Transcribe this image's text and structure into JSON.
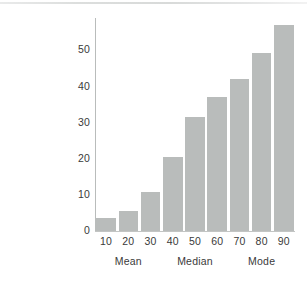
{
  "figure": {
    "background_color": "#ffffff",
    "bar_color": "#b9bcbb",
    "axis_color": "#bcbfbe",
    "text_color": "#3a3a3a"
  },
  "chart_data": {
    "type": "bar",
    "title": "",
    "subtitle": "",
    "xlabel": "",
    "ylabel": "",
    "categories": [
      "10",
      "20",
      "30",
      "40",
      "50",
      "60",
      "70",
      "80",
      "90"
    ],
    "values": [
      3.5,
      5.5,
      10.8,
      20.4,
      31.7,
      37.2,
      42.2,
      49.2,
      57.0
    ],
    "series": [
      {
        "name": "frequency",
        "values": [
          3.5,
          5.5,
          10.8,
          20.4,
          31.7,
          37.2,
          42.2,
          49.2,
          57.0
        ]
      }
    ],
    "ylim": [
      0,
      59
    ],
    "xlim": [
      5,
      95
    ],
    "y_ticks": [
      "0",
      "10",
      "20",
      "30",
      "40",
      "50"
    ],
    "y_tick_values": [
      0,
      10,
      20,
      30,
      40,
      50
    ],
    "x_ticks": [
      "10",
      "20",
      "30",
      "40",
      "50",
      "60",
      "70",
      "80",
      "90"
    ],
    "grid": false,
    "legend": null,
    "legend_position": "none",
    "annotations": [
      {
        "label": "Mean",
        "at_category": "20"
      },
      {
        "label": "Median",
        "at_category": "50"
      },
      {
        "label": "Mode",
        "at_category": "80"
      }
    ],
    "annotation_labels": [
      "Mean",
      "Median",
      "Mode"
    ]
  }
}
